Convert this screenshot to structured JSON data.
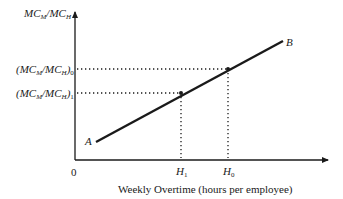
{
  "diagram": {
    "y_axis_label": {
      "main": "MC",
      "sub1": "M",
      "slash": "/MC",
      "sub2": "H"
    },
    "y_ticks": [
      {
        "id": "0",
        "text_open": "(MC",
        "sub_m": "M",
        "mid": "/MC",
        "sub_h": "H",
        "close": ")",
        "sub_idx": "0"
      },
      {
        "id": "1",
        "text_open": "(MC",
        "sub_m": "M",
        "mid": "/MC",
        "sub_h": "H",
        "close": ")",
        "sub_idx": "1"
      }
    ],
    "origin_label": "0",
    "x_ticks": [
      {
        "main": "H",
        "sub": "1"
      },
      {
        "main": "H",
        "sub": "0"
      }
    ],
    "x_axis_label": "Weekly Overtime (hours per employee)",
    "line_start_label": "A",
    "line_end_label": "B",
    "colors": {
      "ink": "#1a1a1a",
      "background": "#ffffff"
    }
  }
}
